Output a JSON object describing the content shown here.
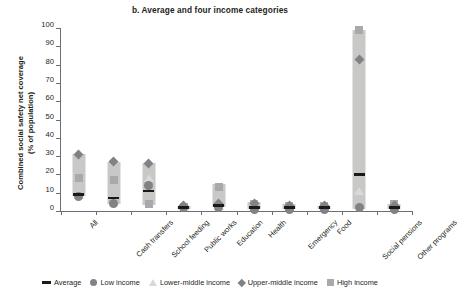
{
  "chart_data": {
    "type": "bar",
    "title": "b. Average and four income categories",
    "xlabel": "",
    "ylabel": "Combined social safety net coverage (% of population)",
    "ylabel_line1": "Combined social safety net coverage",
    "ylabel_line2": "(% of population)",
    "ylim": [
      0,
      100
    ],
    "yticks": [
      0,
      10,
      20,
      30,
      40,
      50,
      60,
      70,
      80,
      90,
      100
    ],
    "ytick_labels": [
      "0",
      "10",
      "20",
      "30",
      "40",
      "50",
      "60",
      "70",
      "80",
      "90",
      "100"
    ],
    "grid": false,
    "legend_position": "bottom",
    "categories": [
      "All",
      "Cash transfers",
      "School feeding",
      "Public works",
      "Education",
      "Health",
      "Emergency",
      "Food",
      "Social pensions",
      "Other programs"
    ],
    "legend": [
      {
        "name": "Average",
        "marker": "dash",
        "color": "#1a1a1a"
      },
      {
        "name": "Low income",
        "marker": "circle",
        "color": "#808285"
      },
      {
        "name": "Lower-middle income",
        "marker": "triangle",
        "color": "#d9dad8"
      },
      {
        "name": "Upper-middle income",
        "marker": "diamond",
        "color": "#808285"
      },
      {
        "name": "High income",
        "marker": "square",
        "color": "#a7a9ac"
      }
    ],
    "series": [
      {
        "name": "Range (box)",
        "type": "range",
        "lows": [
          8,
          4,
          3,
          1,
          2,
          1,
          1,
          1,
          1,
          1
        ],
        "highs": [
          31,
          27,
          26,
          3,
          15,
          5,
          4,
          3,
          99,
          4
        ]
      },
      {
        "name": "Average",
        "marker": "dash",
        "values": [
          9,
          7,
          11,
          2,
          3,
          2,
          2,
          2,
          20,
          2
        ]
      },
      {
        "name": "Low income",
        "marker": "circle",
        "values": [
          8,
          4,
          14,
          2,
          2,
          1,
          1,
          1,
          2,
          1
        ]
      },
      {
        "name": "Lower-middle income",
        "marker": "triangle",
        "values": [
          9,
          5,
          18,
          2,
          3,
          2,
          2,
          2,
          11,
          2
        ]
      },
      {
        "name": "Upper-middle income",
        "marker": "diamond",
        "values": [
          31,
          27,
          26,
          3,
          4,
          4,
          3,
          3,
          83,
          3
        ]
      },
      {
        "name": "High income",
        "marker": "square",
        "values": [
          18,
          17,
          4,
          2,
          13,
          4,
          3,
          3,
          99,
          4
        ]
      }
    ]
  }
}
